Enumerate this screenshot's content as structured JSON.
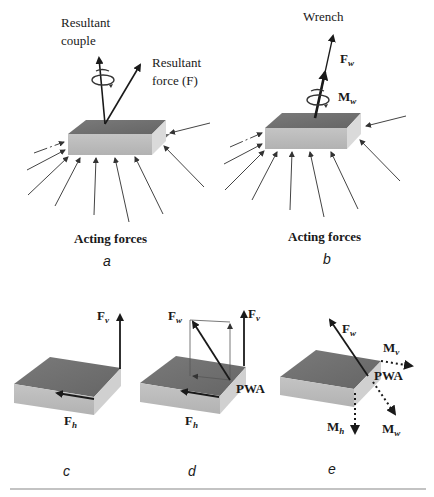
{
  "panels": {
    "a": {
      "id_label": "a",
      "resultant_couple_line1": "Resultant",
      "resultant_couple_line2": "couple",
      "resultant_force_line1": "Resultant",
      "resultant_force_line2": "force (F)",
      "acting_forces": "Acting forces"
    },
    "b": {
      "id_label": "b",
      "title": "Wrench",
      "force_label": "F",
      "force_sub": "w",
      "moment_label": "M",
      "moment_sub": "w",
      "acting_forces": "Acting forces"
    },
    "c": {
      "id_label": "c",
      "fv_label": "F",
      "fv_sub": "v",
      "fh_label": "F",
      "fh_sub": "h"
    },
    "d": {
      "id_label": "d",
      "fw_label": "F",
      "fw_sub": "w",
      "fv_label": "F",
      "fv_sub": "v",
      "fh_label": "F",
      "fh_sub": "h",
      "pwa": "PWA"
    },
    "e": {
      "id_label": "e",
      "fw_label": "F",
      "fw_sub": "w",
      "mv_label": "M",
      "mv_sub": "v",
      "mh_label": "M",
      "mh_sub": "h",
      "mw_label": "M",
      "mw_sub": "w",
      "pwa": "PWA"
    }
  },
  "colors": {
    "box_top": "#6e6e6e",
    "box_front": "#bdbdbd",
    "box_side": "#d9d9d9",
    "ink": "#1a1a1a",
    "rule": "#888888"
  }
}
